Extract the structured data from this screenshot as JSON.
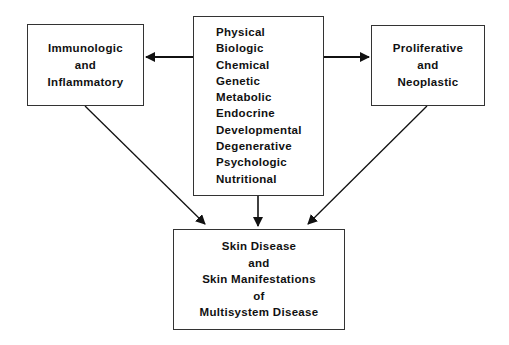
{
  "diagram": {
    "type": "flow",
    "colors": {
      "line": "#111111",
      "box_border": "#333333",
      "background": "#ffffff"
    },
    "center": {
      "bracketed_causes": [
        "Physical",
        "Biologic",
        "Chemical",
        "Genetic"
      ],
      "other_causes": [
        "Metabolic",
        "Endocrine",
        "Developmental",
        "Degenerative",
        "Psychologic",
        "Nutritional"
      ]
    },
    "left": {
      "lines": [
        "Immunologic",
        "and",
        "Inflammatory"
      ]
    },
    "right": {
      "lines": [
        "Proliferative",
        "and",
        "Neoplastic"
      ]
    },
    "bottom": {
      "lines": [
        "Skin Disease",
        "and",
        "Skin Manifestations",
        "of",
        "Multisystem Disease"
      ]
    },
    "edges": [
      {
        "from": "center",
        "to": "left"
      },
      {
        "from": "center",
        "to": "right"
      },
      {
        "from": "center",
        "to": "bottom"
      },
      {
        "from": "left",
        "to": "bottom"
      },
      {
        "from": "right",
        "to": "bottom"
      }
    ]
  }
}
